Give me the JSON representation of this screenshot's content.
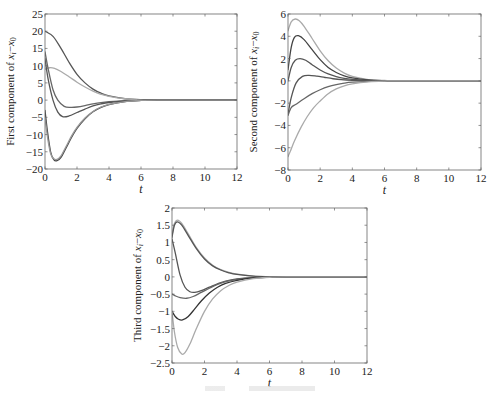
{
  "figure": {
    "width": 495,
    "height": 395,
    "caption_visible_but_illegible": true
  },
  "chart_data": [
    {
      "id": "plot1",
      "type": "line",
      "title": "",
      "xlabel": "t",
      "ylabel": "First component of x_i − x_0",
      "xlim": [
        0,
        12
      ],
      "ylim": [
        -20,
        25
      ],
      "xticks": [
        0,
        2,
        4,
        6,
        8,
        10,
        12
      ],
      "yticks": [
        -20,
        -15,
        -10,
        -5,
        0,
        5,
        10,
        15,
        20,
        25
      ],
      "grid": false,
      "legend": null,
      "box": {
        "x0": 45,
        "y0": 14,
        "x1": 237,
        "y1": 169
      },
      "series": [
        {
          "name": "agent-a",
          "color": "#555555",
          "x": [
            0,
            0.5,
            1,
            1.5,
            2,
            2.5,
            3,
            3.5,
            4,
            5,
            6,
            7,
            12
          ],
          "y": [
            20,
            18.5,
            15,
            11,
            7.5,
            5,
            3.2,
            2,
            1.2,
            0.4,
            0.1,
            0,
            0
          ]
        },
        {
          "name": "agent-b",
          "color": "#aaaaaa",
          "x": [
            0,
            0.3,
            0.6,
            1,
            1.5,
            2,
            2.5,
            3,
            3.5,
            4,
            5,
            6,
            7,
            12
          ],
          "y": [
            9,
            9.4,
            9.2,
            8.3,
            6.8,
            5.2,
            3.8,
            2.6,
            1.7,
            1.1,
            0.4,
            0.1,
            0,
            0
          ]
        },
        {
          "name": "agent-c",
          "color": "#666666",
          "x": [
            0,
            0.2,
            0.5,
            0.8,
            1.2,
            1.6,
            2,
            2.5,
            3,
            3.5,
            4,
            5,
            6,
            7,
            12
          ],
          "y": [
            14,
            9,
            3,
            0,
            -1.8,
            -2.1,
            -2,
            -1.6,
            -1.1,
            -0.7,
            -0.45,
            -0.15,
            -0.05,
            0,
            0
          ]
        },
        {
          "name": "agent-d",
          "color": "#555555",
          "x": [
            0,
            0.2,
            0.5,
            0.8,
            1.1,
            1.5,
            2,
            2.5,
            3,
            3.5,
            4,
            5,
            6,
            7,
            12
          ],
          "y": [
            12,
            6,
            0,
            -3.5,
            -4.8,
            -4.6,
            -3.6,
            -2.6,
            -1.7,
            -1.1,
            -0.7,
            -0.25,
            -0.05,
            0,
            0
          ]
        },
        {
          "name": "agent-e",
          "color": "#444444",
          "x": [
            0,
            0.15,
            0.35,
            0.55,
            0.75,
            1,
            1.3,
            1.7,
            2,
            2.5,
            3,
            3.5,
            4,
            5,
            6,
            7,
            12
          ],
          "y": [
            -3,
            -9,
            -15,
            -17.3,
            -17.6,
            -16.6,
            -14,
            -10.5,
            -8.2,
            -5.4,
            -3.4,
            -2.1,
            -1.3,
            -0.45,
            -0.1,
            0,
            0
          ]
        },
        {
          "name": "agent-f",
          "color": "#999999",
          "x": [
            0,
            0.15,
            0.35,
            0.55,
            0.75,
            1,
            1.3,
            1.7,
            2,
            2.5,
            3,
            3.5,
            4,
            5,
            6,
            7,
            12
          ],
          "y": [
            -5,
            -10.5,
            -15.5,
            -17,
            -17.2,
            -16.2,
            -13.6,
            -10.1,
            -7.9,
            -5.2,
            -3.3,
            -2,
            -1.25,
            -0.43,
            -0.1,
            0,
            0
          ]
        }
      ]
    },
    {
      "id": "plot2",
      "type": "line",
      "title": "",
      "xlabel": "t",
      "ylabel": "Second component of x_i − x_0",
      "xlim": [
        0,
        12
      ],
      "ylim": [
        -8,
        6
      ],
      "xticks": [
        0,
        2,
        4,
        6,
        8,
        10,
        12
      ],
      "yticks": [
        -8,
        -6,
        -4,
        -2,
        0,
        2,
        4,
        6
      ],
      "grid": false,
      "legend": null,
      "box": {
        "x0": 288,
        "y0": 14,
        "x1": 481,
        "y1": 170
      },
      "series": [
        {
          "name": "agent-a",
          "color": "#aaaaaa",
          "x": [
            0,
            0.2,
            0.45,
            0.7,
            1,
            1.5,
            2,
            2.5,
            3,
            3.5,
            4,
            5,
            6,
            7,
            12
          ],
          "y": [
            4.5,
            5.3,
            5.55,
            5.4,
            4.9,
            3.8,
            2.7,
            1.8,
            1.15,
            0.7,
            0.4,
            0.12,
            0.03,
            0,
            0
          ]
        },
        {
          "name": "agent-b",
          "color": "#444444",
          "x": [
            0,
            0.2,
            0.4,
            0.65,
            1,
            1.5,
            2,
            2.5,
            3,
            3.5,
            4,
            5,
            6,
            7,
            12
          ],
          "y": [
            1,
            3,
            3.9,
            4.05,
            3.7,
            2.8,
            1.9,
            1.2,
            0.75,
            0.45,
            0.27,
            0.08,
            0.02,
            0,
            0
          ]
        },
        {
          "name": "agent-c",
          "color": "#555555",
          "x": [
            0,
            0.2,
            0.45,
            0.75,
            1.1,
            1.5,
            2,
            2.5,
            3,
            3.5,
            4,
            5,
            6,
            7,
            12
          ],
          "y": [
            0,
            1.2,
            1.85,
            2,
            1.85,
            1.45,
            0.98,
            0.62,
            0.38,
            0.22,
            0.13,
            0.04,
            0.01,
            0,
            0
          ]
        },
        {
          "name": "agent-d",
          "color": "#555555",
          "x": [
            0,
            0.2,
            0.5,
            0.9,
            1.3,
            1.8,
            2.3,
            2.8,
            3.3,
            4,
            5,
            6,
            7,
            12
          ],
          "y": [
            -3,
            -1.5,
            -0.2,
            0.4,
            0.5,
            0.42,
            0.3,
            0.19,
            0.11,
            0.05,
            0.01,
            0,
            0,
            0
          ]
        },
        {
          "name": "agent-e",
          "color": "#666666",
          "x": [
            0,
            0.2,
            0.5,
            1,
            1.5,
            2,
            2.5,
            3,
            3.5,
            4,
            5,
            6,
            7,
            12
          ],
          "y": [
            -3.1,
            -2.4,
            -2.1,
            -1.6,
            -1.15,
            -0.8,
            -0.52,
            -0.33,
            -0.2,
            -0.12,
            -0.04,
            -0.01,
            0,
            0
          ]
        },
        {
          "name": "agent-f",
          "color": "#aaaaaa",
          "x": [
            0,
            0.15,
            0.4,
            0.8,
            1.2,
            1.6,
            2,
            2.5,
            3,
            3.5,
            4,
            5,
            6,
            7,
            12
          ],
          "y": [
            -6.8,
            -6.3,
            -5.4,
            -4.2,
            -3.2,
            -2.4,
            -1.8,
            -1.15,
            -0.72,
            -0.44,
            -0.27,
            -0.09,
            -0.02,
            0,
            0
          ]
        }
      ]
    },
    {
      "id": "plot3",
      "type": "line",
      "title": "",
      "xlabel": "t",
      "ylabel": "Third component of x_i − x_0",
      "xlim": [
        0,
        12
      ],
      "ylim": [
        -2.5,
        2
      ],
      "xticks": [
        0,
        2,
        4,
        6,
        8,
        10,
        12
      ],
      "yticks": [
        -2.5,
        -2,
        -1.5,
        -1,
        -0.5,
        0,
        0.5,
        1,
        1.5,
        2
      ],
      "grid": false,
      "legend": null,
      "box": {
        "x0": 172,
        "y0": 208,
        "x1": 367,
        "y1": 363
      },
      "series": [
        {
          "name": "agent-a",
          "color": "#aaaaaa",
          "x": [
            0,
            0.15,
            0.35,
            0.6,
            1,
            1.5,
            2,
            2.5,
            3,
            3.5,
            4,
            5,
            6,
            7,
            12
          ],
          "y": [
            1.2,
            1.55,
            1.65,
            1.55,
            1.25,
            0.85,
            0.55,
            0.34,
            0.21,
            0.13,
            0.08,
            0.025,
            0.005,
            0,
            0
          ]
        },
        {
          "name": "agent-b",
          "color": "#555555",
          "x": [
            0,
            0.15,
            0.33,
            0.6,
            1,
            1.5,
            2,
            2.5,
            3,
            3.5,
            4,
            5,
            6,
            7,
            12
          ],
          "y": [
            1.15,
            1.5,
            1.6,
            1.5,
            1.2,
            0.82,
            0.52,
            0.32,
            0.2,
            0.12,
            0.07,
            0.02,
            0.005,
            0,
            0
          ]
        },
        {
          "name": "agent-c",
          "color": "#555555",
          "x": [
            0,
            0.2,
            0.5,
            0.8,
            1.1,
            1.4,
            1.8,
            2.3,
            2.8,
            3.3,
            4,
            5,
            6,
            7,
            12
          ],
          "y": [
            1.1,
            0.7,
            0.05,
            -0.3,
            -0.43,
            -0.45,
            -0.4,
            -0.3,
            -0.2,
            -0.12,
            -0.06,
            -0.02,
            -0.005,
            0,
            0
          ]
        },
        {
          "name": "agent-d",
          "color": "#666666",
          "x": [
            0,
            0.2,
            0.5,
            0.9,
            1.3,
            1.8,
            2.3,
            2.8,
            3.3,
            4,
            5,
            6,
            7,
            12
          ],
          "y": [
            -0.5,
            -0.55,
            -0.6,
            -0.62,
            -0.57,
            -0.45,
            -0.33,
            -0.22,
            -0.14,
            -0.07,
            -0.02,
            -0.005,
            0,
            0
          ]
        },
        {
          "name": "agent-e",
          "color": "#333333",
          "x": [
            0,
            0.2,
            0.4,
            0.65,
            1,
            1.4,
            1.8,
            2.3,
            2.8,
            3.3,
            4,
            5,
            6,
            7,
            12
          ],
          "y": [
            -1,
            -1.15,
            -1.23,
            -1.25,
            -1.15,
            -0.93,
            -0.7,
            -0.47,
            -0.3,
            -0.19,
            -0.1,
            -0.03,
            -0.008,
            0,
            0
          ]
        },
        {
          "name": "agent-f",
          "color": "#aaaaaa",
          "x": [
            0,
            0.15,
            0.35,
            0.6,
            0.8,
            1.1,
            1.5,
            2,
            2.5,
            3,
            3.5,
            4,
            5,
            6,
            7,
            12
          ],
          "y": [
            -1,
            -1.6,
            -2.05,
            -2.24,
            -2.2,
            -1.95,
            -1.5,
            -1.0,
            -0.64,
            -0.4,
            -0.25,
            -0.15,
            -0.05,
            -0.01,
            0,
            0
          ]
        }
      ]
    }
  ]
}
